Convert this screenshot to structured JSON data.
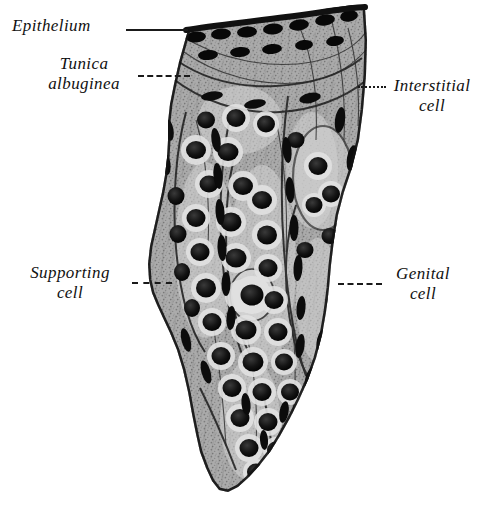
{
  "figure": {
    "background_color": "#ffffff",
    "ink_color": "#111111",
    "tissue_mid_tone": "#9a9a9a",
    "nucleus_color": "#101010",
    "halo_color": "#dcdcdc"
  },
  "labels": [
    {
      "id": "epithelium",
      "text": "Epithelium",
      "text2": "",
      "leader": "solid"
    },
    {
      "id": "tunica",
      "text": "Tunica",
      "text2": "albuginea",
      "leader": "dashed"
    },
    {
      "id": "interstitial",
      "text": "Interstitial",
      "text2": "cell",
      "leader": "dotted"
    },
    {
      "id": "supporting",
      "text": "Supporting",
      "text2": "cell",
      "leader": "dashed"
    },
    {
      "id": "genital",
      "text": "Genital",
      "text2": "cell",
      "leader": "dashed"
    }
  ]
}
